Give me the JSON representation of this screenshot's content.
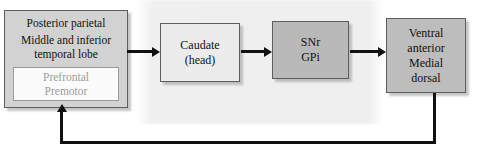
{
  "diagram": {
    "watermark_top": "",
    "watermark_bottom": "",
    "colors": {
      "cortex_fill": "#d2d2d2",
      "inner_fill": "#fbfbfb",
      "inner_text": "#9c9c9c",
      "caudate_fill": "#ececec",
      "snr_fill": "#b9b9b9",
      "thalamus_fill": "#bdbdbd",
      "border": "#5d5d5d",
      "arrow": "#111111",
      "background": "#ffffff"
    },
    "nodes": {
      "cortex": {
        "name": "cortex-association-areas",
        "lines": [
          "Posterior parietal",
          "Middle and inferior",
          "temporal lobe"
        ],
        "inner": {
          "name": "prefrontal-premotor",
          "lines": [
            "Prefrontal",
            "Premotor"
          ]
        }
      },
      "caudate": {
        "name": "caudate-head",
        "lines": [
          "Caudate",
          "(head)"
        ]
      },
      "snr_gpi": {
        "name": "snr-gpi",
        "lines": [
          "SNr",
          "GPi"
        ]
      },
      "thalamus": {
        "name": "thalamic-nuclei",
        "lines": [
          "Ventral",
          "anterior",
          "Medial",
          "dorsal"
        ]
      }
    },
    "arrows": [
      {
        "name": "arrow-cortex-to-caudate",
        "from": "cortex",
        "to": "caudate",
        "direction": "right"
      },
      {
        "name": "arrow-caudate-to-snr",
        "from": "caudate",
        "to": "snr_gpi",
        "direction": "right"
      },
      {
        "name": "arrow-snr-to-thalamus",
        "from": "snr_gpi",
        "to": "thalamus",
        "direction": "right"
      },
      {
        "name": "arrow-thalamus-to-cortex-feedback",
        "from": "thalamus",
        "to": "cortex",
        "direction": "feedback-loop"
      }
    ]
  }
}
